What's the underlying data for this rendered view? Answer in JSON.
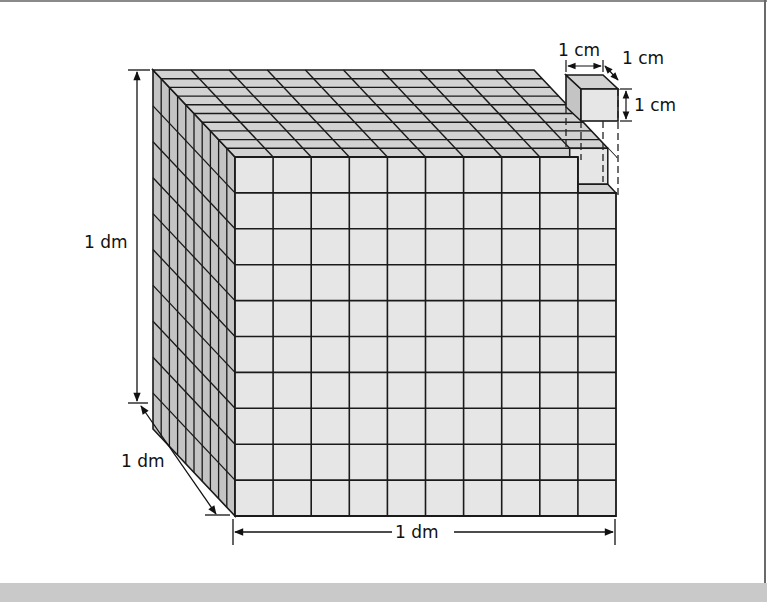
{
  "figure": {
    "divisions": 10,
    "colors": {
      "front_face": "#e6e6e6",
      "top_face": "#d2d2d2",
      "side_face": "#c4c4c4",
      "grid_line": "#1a1a1a",
      "background": "#ffffff",
      "bottom_band": "#c9c9c9"
    }
  },
  "labels": {
    "height": "1 dm",
    "depth": "1 dm",
    "width": "1 dm",
    "small_cube_width": "1 cm",
    "small_cube_depth": "1 cm",
    "small_cube_height": "1 cm"
  }
}
